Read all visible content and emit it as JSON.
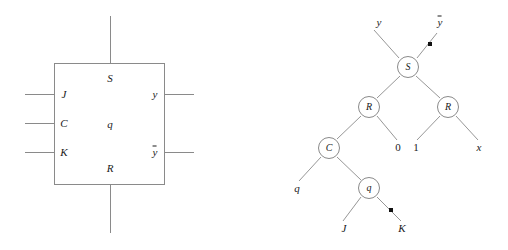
{
  "figure": {
    "background_color": "#ffffff",
    "line_color": "#8a8a8a",
    "text_color": "#1a1a1a",
    "dot_color": "#111111"
  },
  "block_diagram": {
    "name": "jk-flip-flop-block",
    "box": {
      "x": 54,
      "y": 63,
      "width": 111,
      "height": 122
    },
    "internal_labels": [
      {
        "id": "S",
        "text": "S",
        "x": 110,
        "y": 78,
        "italic": true
      },
      {
        "id": "q",
        "text": "q",
        "x": 110,
        "y": 124,
        "italic": true
      },
      {
        "id": "R",
        "text": "R",
        "x": 110,
        "y": 168,
        "italic": true
      }
    ],
    "input_labels": [
      {
        "id": "J",
        "text": "J",
        "x": 64,
        "y": 94,
        "italic": true
      },
      {
        "id": "C",
        "text": "C",
        "x": 64,
        "y": 123,
        "italic": true
      },
      {
        "id": "K",
        "text": "K",
        "x": 64,
        "y": 152,
        "italic": true
      }
    ],
    "output_labels": [
      {
        "id": "y",
        "text": "y",
        "overline": false,
        "x": 155,
        "y": 94,
        "italic": true
      },
      {
        "id": "ybar",
        "text": "y",
        "overline": true,
        "x": 155,
        "y": 152,
        "italic": true
      }
    ],
    "wires": [
      {
        "id": "in-J",
        "orientation": "h",
        "x": 25,
        "y": 94,
        "length": 30
      },
      {
        "id": "in-C",
        "orientation": "h",
        "x": 25,
        "y": 123,
        "length": 30
      },
      {
        "id": "in-K",
        "orientation": "h",
        "x": 25,
        "y": 152,
        "length": 30
      },
      {
        "id": "out-y",
        "orientation": "h",
        "x": 165,
        "y": 94,
        "length": 29
      },
      {
        "id": "out-ybar",
        "orientation": "h",
        "x": 165,
        "y": 152,
        "length": 29
      },
      {
        "id": "top-S",
        "orientation": "v",
        "x": 110,
        "y": 16,
        "length": 48
      },
      {
        "id": "bot-R",
        "orientation": "v",
        "x": 110,
        "y": 185,
        "length": 48
      }
    ]
  },
  "tree_diagram": {
    "name": "flip-flop-tree",
    "nodes": [
      {
        "id": "S",
        "text": "S",
        "x": 408,
        "y": 67,
        "r": 11
      },
      {
        "id": "R1",
        "text": "R",
        "x": 369,
        "y": 107,
        "r": 11
      },
      {
        "id": "R2",
        "text": "R",
        "x": 448,
        "y": 107,
        "r": 11
      },
      {
        "id": "C",
        "text": "C",
        "x": 329,
        "y": 148,
        "r": 11
      },
      {
        "id": "q",
        "text": "q",
        "x": 369,
        "y": 188,
        "r": 11
      }
    ],
    "leaves": [
      {
        "id": "y",
        "text": "y",
        "overline": false,
        "x": 379,
        "y": 22,
        "italic": true
      },
      {
        "id": "ybar",
        "text": "y",
        "overline": true,
        "x": 440,
        "y": 22,
        "italic": true
      },
      {
        "id": "zero",
        "text": "0",
        "overline": false,
        "x": 398,
        "y": 147,
        "italic": false
      },
      {
        "id": "one",
        "text": "1",
        "overline": false,
        "x": 416,
        "y": 147,
        "italic": false
      },
      {
        "id": "x",
        "text": "x",
        "overline": false,
        "x": 479,
        "y": 147,
        "italic": true
      },
      {
        "id": "q2",
        "text": "q",
        "overline": false,
        "x": 297,
        "y": 188,
        "italic": true
      },
      {
        "id": "J",
        "text": "J",
        "overline": false,
        "x": 344,
        "y": 228,
        "italic": true
      },
      {
        "id": "K",
        "text": "K",
        "overline": false,
        "x": 402,
        "y": 228,
        "italic": true
      }
    ],
    "edges": [
      {
        "id": "S-y",
        "x1": 399,
        "y1": 58,
        "x2": 374,
        "y2": 30
      },
      {
        "id": "S-ybar",
        "x1": 417,
        "y1": 58,
        "x2": 437,
        "y2": 33
      },
      {
        "id": "S-R1",
        "x1": 400,
        "y1": 76,
        "x2": 377,
        "y2": 98
      },
      {
        "id": "S-R2",
        "x1": 416,
        "y1": 76,
        "x2": 440,
        "y2": 98
      },
      {
        "id": "R1-C",
        "x1": 361,
        "y1": 116,
        "x2": 337,
        "y2": 139
      },
      {
        "id": "R1-0",
        "x1": 377,
        "y1": 116,
        "x2": 397,
        "y2": 140
      },
      {
        "id": "R2-1",
        "x1": 440,
        "y1": 116,
        "x2": 417,
        "y2": 140
      },
      {
        "id": "R2-x",
        "x1": 456,
        "y1": 116,
        "x2": 478,
        "y2": 140
      },
      {
        "id": "C-q2",
        "x1": 321,
        "y1": 157,
        "x2": 299,
        "y2": 181
      },
      {
        "id": "C-q",
        "x1": 337,
        "y1": 157,
        "x2": 361,
        "y2": 180
      },
      {
        "id": "q-J",
        "x1": 361,
        "y1": 197,
        "x2": 343,
        "y2": 221
      },
      {
        "id": "q-K",
        "x1": 377,
        "y1": 197,
        "x2": 401,
        "y2": 221
      }
    ],
    "inversion_dots": [
      {
        "id": "dot-ybar",
        "x": 430,
        "y": 44
      },
      {
        "id": "dot-K",
        "x": 391,
        "y": 210
      }
    ]
  }
}
